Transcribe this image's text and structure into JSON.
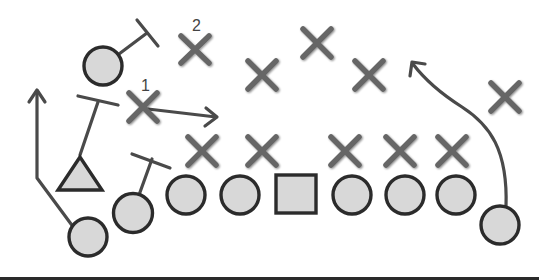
{
  "diagram": {
    "type": "football-play",
    "colors": {
      "offense_fill": "#d8d8d8",
      "offense_stroke": "#2b2b2b",
      "defense": "#666666",
      "route": "#4a4a4a",
      "ground_line": "#2a2a2a"
    },
    "labels": {
      "defender_1": "1",
      "defender_2": "2"
    },
    "offense": [
      {
        "id": "wr-left-top",
        "shape": "circle",
        "x": 103,
        "y": 66
      },
      {
        "id": "qb",
        "shape": "triangle",
        "x": 80,
        "y": 175
      },
      {
        "id": "wr-left-bottom",
        "shape": "circle",
        "x": 88,
        "y": 237
      },
      {
        "id": "te-left",
        "shape": "circle",
        "x": 133,
        "y": 213
      },
      {
        "id": "lt",
        "shape": "circle",
        "x": 186,
        "y": 195
      },
      {
        "id": "lg",
        "shape": "circle",
        "x": 240,
        "y": 195
      },
      {
        "id": "center",
        "shape": "square",
        "x": 296,
        "y": 194
      },
      {
        "id": "rg",
        "shape": "circle",
        "x": 352,
        "y": 195
      },
      {
        "id": "rt",
        "shape": "circle",
        "x": 405,
        "y": 195
      },
      {
        "id": "te-right",
        "shape": "circle",
        "x": 456,
        "y": 195
      },
      {
        "id": "wr-right",
        "shape": "circle",
        "x": 500,
        "y": 225
      }
    ],
    "defense": [
      {
        "id": "d2",
        "x": 195,
        "y": 50,
        "label": "2"
      },
      {
        "id": "lb-a",
        "x": 262,
        "y": 75
      },
      {
        "id": "s",
        "x": 317,
        "y": 43
      },
      {
        "id": "lb-b",
        "x": 369,
        "y": 75
      },
      {
        "id": "cb-right",
        "x": 505,
        "y": 97
      },
      {
        "id": "d1",
        "x": 143,
        "y": 107,
        "label": "1"
      },
      {
        "id": "dl-1",
        "x": 202,
        "y": 151
      },
      {
        "id": "dl-2",
        "x": 262,
        "y": 151
      },
      {
        "id": "dl-3",
        "x": 345,
        "y": 151
      },
      {
        "id": "dl-4",
        "x": 400,
        "y": 151
      },
      {
        "id": "dl-5",
        "x": 452,
        "y": 151
      }
    ]
  }
}
